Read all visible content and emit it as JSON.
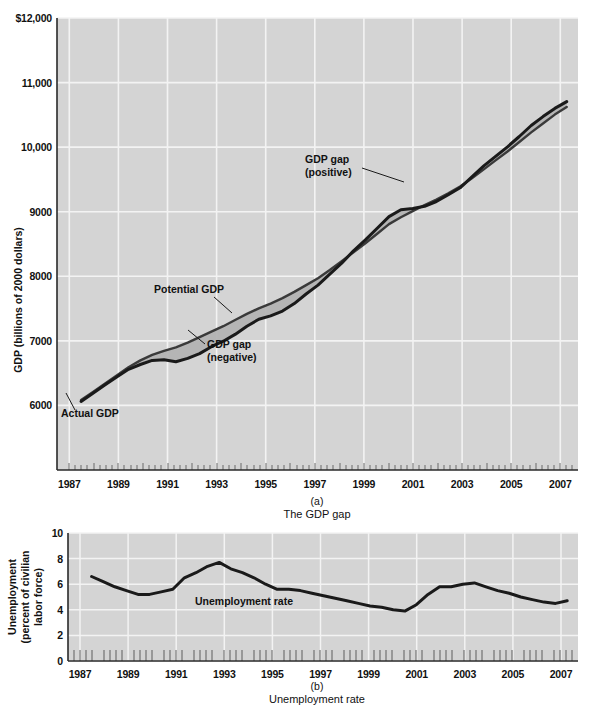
{
  "figure": {
    "panels": [
      {
        "id": "a",
        "letter": "(a)",
        "caption": "The GDP gap",
        "y_axis_title": "GDP (billions of 2000 dollars)",
        "y_ticks": [
          "$12,000",
          "11,000",
          "10,000",
          "9000",
          "8000",
          "7000",
          "6000"
        ],
        "x_ticks": [
          "1987",
          "1989",
          "1991",
          "1993",
          "1995",
          "1997",
          "1999",
          "2001",
          "2003",
          "2005",
          "2007"
        ],
        "annotations": [
          {
            "name": "gdp-gap-positive",
            "lines": [
              "GDP gap",
              "(positive)"
            ]
          },
          {
            "name": "potential-gdp",
            "lines": [
              "Potential GDP"
            ]
          },
          {
            "name": "gdp-gap-negative",
            "lines": [
              "GDP gap",
              "(negative)"
            ]
          },
          {
            "name": "actual-gdp",
            "lines": [
              "Actual GDP"
            ]
          }
        ]
      },
      {
        "id": "b",
        "letter": "(b)",
        "caption": "Unemployment rate",
        "y_axis_title_lines": [
          "Unemployment",
          "(percent of civilian",
          "labor force)"
        ],
        "y_ticks": [
          "10",
          "8",
          "6",
          "4",
          "2",
          "0"
        ],
        "x_ticks": [
          "1987",
          "1989",
          "1991",
          "1993",
          "1995",
          "1997",
          "1999",
          "2001",
          "2003",
          "2005",
          "2007"
        ],
        "annotations": [
          {
            "name": "unemployment-rate-label",
            "lines": [
              "Unemployment rate"
            ]
          }
        ]
      }
    ],
    "colors": {
      "plot_background": "#d4d4d4",
      "gridline": "#f2f2f2",
      "curve": "#1a1a1a",
      "gap_fill": "#b0b0b0",
      "axis": "#333333",
      "page_background": "#ffffff"
    }
  },
  "chart_data": [
    {
      "type": "line",
      "id": "gdp-gap-chart",
      "title": "The GDP gap",
      "xlabel": "",
      "ylabel": "GDP (billions of 2000 dollars)",
      "xlim": [
        1986.5,
        2007.75
      ],
      "ylim": [
        5400,
        12000
      ],
      "ytick_values": [
        6000,
        7000,
        8000,
        9000,
        10000,
        11000,
        12000
      ],
      "ytick_labels": [
        "6000",
        "7000",
        "8000",
        "9000",
        "10,000",
        "11,000",
        "$12,000"
      ],
      "xtick_values": [
        1987,
        1989,
        1991,
        1993,
        1995,
        1997,
        1999,
        2001,
        2003,
        2005,
        2007
      ],
      "grid": true,
      "legend": "inline-annotations",
      "x": [
        1987.0,
        1987.5,
        1988.0,
        1988.5,
        1989.0,
        1989.5,
        1990.0,
        1990.5,
        1991.0,
        1991.5,
        1992.0,
        1992.5,
        1993.0,
        1993.5,
        1994.0,
        1994.5,
        1995.0,
        1995.5,
        1996.0,
        1996.5,
        1997.0,
        1997.5,
        1998.0,
        1998.5,
        1999.0,
        1999.5,
        2000.0,
        2000.5,
        2001.0,
        2001.5,
        2002.0,
        2002.5,
        2003.0,
        2003.5,
        2004.0,
        2004.5,
        2005.0,
        2005.5,
        2006.0,
        2006.5,
        2007.0,
        2007.5
      ],
      "series": [
        {
          "name": "Actual GDP",
          "values": [
            6400,
            6520,
            6640,
            6760,
            6870,
            6940,
            7000,
            7010,
            6980,
            7030,
            7100,
            7200,
            7280,
            7380,
            7500,
            7600,
            7650,
            7720,
            7830,
            7970,
            8100,
            8260,
            8420,
            8600,
            8760,
            8930,
            9100,
            9200,
            9220,
            9250,
            9320,
            9420,
            9520,
            9680,
            9840,
            9980,
            10120,
            10270,
            10430,
            10560,
            10680,
            10780
          ]
        },
        {
          "name": "Potential GDP",
          "values": [
            6420,
            6540,
            6660,
            6780,
            6900,
            7000,
            7080,
            7140,
            7190,
            7260,
            7340,
            7420,
            7500,
            7590,
            7680,
            7760,
            7830,
            7910,
            8000,
            8100,
            8200,
            8320,
            8450,
            8580,
            8710,
            8850,
            8990,
            9090,
            9180,
            9270,
            9350,
            9440,
            9540,
            9660,
            9790,
            9920,
            10050,
            10190,
            10330,
            10460,
            10590,
            10700
          ]
        }
      ],
      "annotations": [
        {
          "text": "Actual GDP",
          "x": 1988.0,
          "y": 6500
        },
        {
          "text": "Potential GDP",
          "x": 1992.0,
          "y": 7950
        },
        {
          "text": "GDP gap (negative)",
          "x": 1994.0,
          "y": 7200
        },
        {
          "text": "GDP gap (positive)",
          "x": 1998.5,
          "y": 9700
        }
      ],
      "notes": "Shaded band between Actual GDP and Potential GDP; negative gap roughly 1990-1997, positive gap roughly 1998-2001 and 2005-2007."
    },
    {
      "type": "line",
      "id": "unemployment-rate-chart",
      "title": "Unemployment rate",
      "xlabel": "",
      "ylabel": "Unemployment (percent of civilian labor force)",
      "xlim": [
        1986.5,
        2007.75
      ],
      "ylim": [
        0,
        10
      ],
      "ytick_values": [
        0,
        2,
        4,
        6,
        8,
        10
      ],
      "ytick_labels": [
        "0",
        "2",
        "4",
        "6",
        "8",
        "10"
      ],
      "xtick_values": [
        1987,
        1989,
        1991,
        1993,
        1995,
        1997,
        1999,
        2001,
        2003,
        2005,
        2007
      ],
      "grid": true,
      "x": [
        1987.0,
        1987.5,
        1988.0,
        1988.5,
        1989.0,
        1989.5,
        1990.0,
        1990.5,
        1991.0,
        1991.5,
        1992.0,
        1992.5,
        1993.0,
        1993.5,
        1994.0,
        1994.5,
        1995.0,
        1995.5,
        1996.0,
        1996.5,
        1997.0,
        1997.5,
        1998.0,
        1998.5,
        1999.0,
        1999.5,
        2000.0,
        2000.5,
        2001.0,
        2001.5,
        2002.0,
        2002.5,
        2003.0,
        2003.5,
        2004.0,
        2004.5,
        2005.0,
        2005.5,
        2006.0,
        2006.5,
        2007.0,
        2007.5
      ],
      "series": [
        {
          "name": "Unemployment rate",
          "values": [
            6.6,
            6.2,
            5.8,
            5.5,
            5.2,
            5.2,
            5.4,
            5.6,
            6.5,
            6.9,
            7.4,
            7.7,
            7.2,
            6.9,
            6.5,
            6.0,
            5.6,
            5.6,
            5.5,
            5.3,
            5.1,
            4.9,
            4.7,
            4.5,
            4.3,
            4.2,
            4.0,
            3.9,
            4.4,
            5.2,
            5.8,
            5.8,
            6.0,
            6.1,
            5.8,
            5.5,
            5.3,
            5.0,
            4.8,
            4.6,
            4.5,
            4.7
          ]
        }
      ],
      "annotations": [
        {
          "text": "Unemployment rate",
          "x": 1994.0,
          "y": 4.6
        }
      ]
    }
  ]
}
